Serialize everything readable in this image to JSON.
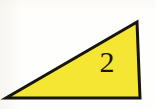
{
  "figure": {
    "name": "right-triangle-figure",
    "type": "geometry-diagram",
    "canvas": {
      "width": 155,
      "height": 109,
      "background_color": "#fefefd"
    },
    "shape": {
      "kind": "triangle",
      "variant": "right-triangle",
      "fill_color": "#f5e633",
      "stroke_color": "#17160e",
      "stroke_width": 3,
      "points": "6,98 140,98 137,22",
      "vertices": [
        {
          "name": "bottom-left",
          "x": 6,
          "y": 98
        },
        {
          "name": "bottom-right",
          "x": 140,
          "y": 98
        },
        {
          "name": "top-right",
          "x": 137,
          "y": 22
        }
      ]
    },
    "label": {
      "text": "2",
      "color": "#19180f",
      "x": 106,
      "y": 62
    }
  }
}
